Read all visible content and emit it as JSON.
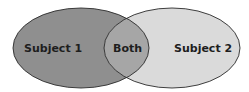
{
  "diagram": {
    "type": "venn",
    "sets": [
      {
        "label": "Subject 1",
        "fill": "#8f8f8f"
      },
      {
        "label": "Subject 2",
        "fill": "#dadada"
      }
    ],
    "intersection": {
      "label": "Both",
      "fill": "#a6a6a6"
    },
    "stroke": "#2a2a2a"
  }
}
